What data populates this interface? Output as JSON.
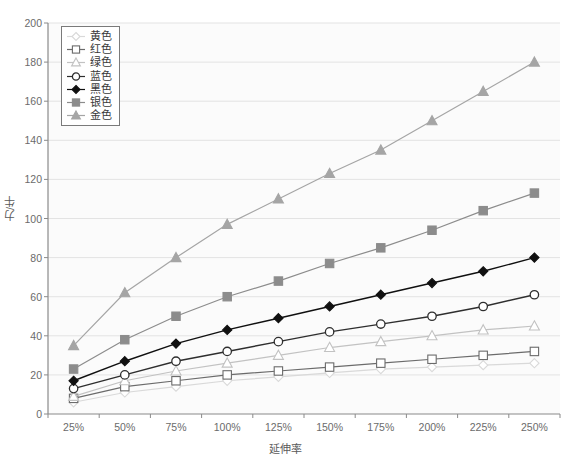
{
  "chart_data": {
    "type": "line",
    "title": "",
    "xlabel": "延伸率",
    "ylabel": "力/牛",
    "categories": [
      "25%",
      "50%",
      "75%",
      "100%",
      "125%",
      "150%",
      "175%",
      "200%",
      "225%",
      "250%"
    ],
    "ylim": [
      0,
      200
    ],
    "yticks": [
      0,
      20,
      40,
      60,
      80,
      100,
      120,
      140,
      160,
      180,
      200
    ],
    "grid": true,
    "legend_position": "top-left",
    "series": [
      {
        "name": "黄色",
        "marker": "diamond-open",
        "color": "#d9d9d9",
        "values": [
          6,
          11,
          14,
          17,
          19,
          21,
          23,
          24,
          25,
          26
        ]
      },
      {
        "name": "红色",
        "marker": "square-open",
        "color": "#6b6b6b",
        "values": [
          8,
          14,
          17,
          20,
          22,
          24,
          26,
          28,
          30,
          32
        ]
      },
      {
        "name": "绿色",
        "marker": "triangle-open",
        "color": "#c2c2c2",
        "values": [
          9,
          17,
          22,
          26,
          30,
          34,
          37,
          40,
          43,
          45
        ]
      },
      {
        "name": "蓝色",
        "marker": "circle-open",
        "color": "#2e2e2e",
        "values": [
          13,
          20,
          27,
          32,
          37,
          42,
          46,
          50,
          55,
          61
        ]
      },
      {
        "name": "黑色",
        "marker": "diamond-filled",
        "color": "#101010",
        "values": [
          17,
          27,
          36,
          43,
          49,
          55,
          61,
          67,
          73,
          80
        ]
      },
      {
        "name": "银色",
        "marker": "square-filled",
        "color": "#8c8c8c",
        "values": [
          23,
          38,
          50,
          60,
          68,
          77,
          85,
          94,
          104,
          113
        ]
      },
      {
        "name": "金色",
        "marker": "triangle-filled",
        "color": "#a5a5a5",
        "values": [
          35,
          62,
          80,
          97,
          110,
          123,
          135,
          150,
          165,
          180
        ]
      }
    ]
  },
  "axis": {
    "y_tick_labels": [
      "200",
      "180",
      "160",
      "140",
      "120",
      "100",
      "80",
      "60",
      "40",
      "20",
      "0"
    ],
    "x_tick_labels": [
      "25%",
      "50%",
      "75%",
      "100%",
      "125%",
      "150%",
      "175%",
      "200%",
      "225%",
      "250%"
    ]
  },
  "colors": {
    "plot_background": "#fbfbfb",
    "grid": "#e3e3e3",
    "axis": "#8a8a8a",
    "tick_text": "#6b6b6b",
    "label_text": "#5a5a5a"
  }
}
